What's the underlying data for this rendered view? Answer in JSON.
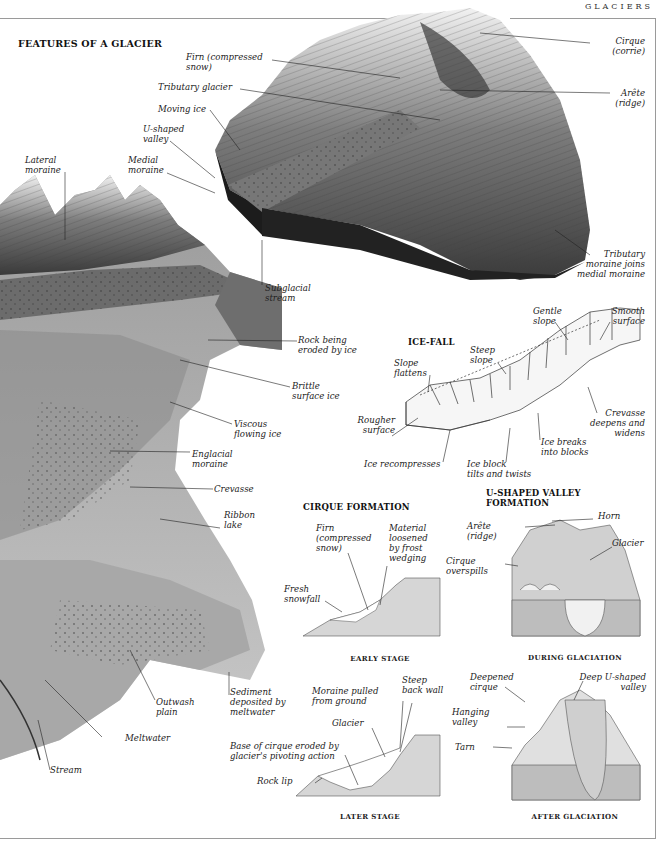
{
  "running_head": "GLACIERS",
  "main_diagram": {
    "title": "FEATURES OF A GLACIER",
    "labels": {
      "firn": "Firn (compressed\nsnow)",
      "tributary_glacier": "Tributary glacier",
      "moving_ice": "Moving ice",
      "u_shaped_valley": "U-shaped\nvalley",
      "medial_moraine": "Medial\nmoraine",
      "lateral_moraine": "Lateral\nmoraine",
      "cirque": "Cirque\n(corrie)",
      "arete": "Arête\n(ridge)",
      "tributary_moraine_joins": "Tributary\nmoraine joins\nmedial moraine",
      "subglacial_stream": "Subglacial\nstream",
      "rock_being_eroded": "Rock being\neroded by ice",
      "brittle_surface_ice": "Brittle\nsurface ice",
      "viscous_flowing_ice": "Viscous\nflowing ice",
      "englacial_moraine": "Englacial\nmoraine",
      "crevasse": "Crevasse",
      "ribbon_lake": "Ribbon\nlake",
      "outwash_plain": "Outwash\nplain",
      "sediment_deposited": "Sediment\ndeposited by\nmeltwater",
      "meltwater": "Meltwater",
      "stream": "Stream"
    }
  },
  "ice_fall": {
    "title": "ICE-FALL",
    "labels": {
      "gentle_slope": "Gentle\nslope",
      "smooth_surface": "Smooth\nsurface",
      "steep_slope": "Steep\nslope",
      "slope_flattens": "Slope\nflattens",
      "rougher_surface": "Rougher\nsurface",
      "crevasse_deepens": "Crevasse\ndeepens and\nwidens",
      "ice_breaks": "Ice breaks\ninto blocks",
      "ice_recompresses": "Ice recompresses",
      "ice_block_tilts": "Ice block\ntilts and twists"
    }
  },
  "cirque_formation": {
    "title": "CIRQUE FORMATION",
    "early": {
      "caption": "EARLY STAGE",
      "labels": {
        "firn": "Firn\n(compressed\nsnow)",
        "material_loosened": "Material\nloosened\nby frost\nwedging",
        "fresh_snowfall": "Fresh\nsnowfall"
      }
    },
    "later": {
      "caption": "LATER STAGE",
      "labels": {
        "moraine_pulled": "Moraine pulled\nfrom ground",
        "steep_back_wall": "Steep\nback wall",
        "glacier": "Glacier",
        "base_of_cirque": "Base of cirque eroded by\nglacier's pivoting action",
        "rock_lip": "Rock lip"
      }
    }
  },
  "u_valley_formation": {
    "title": "U-SHAPED VALLEY\nFORMATION",
    "during": {
      "caption": "DURING GLACIATION",
      "labels": {
        "horn": "Horn",
        "arete": "Arête\n(ridge)",
        "glacier": "Glacier",
        "cirque_overspills": "Cirque\noverspills"
      }
    },
    "after": {
      "caption": "AFTER GLACIATION",
      "labels": {
        "deepened_cirque": "Deepened\ncirque",
        "deep_u_valley": "Deep U-shaped\nvalley",
        "hanging_valley": "Hanging\nvalley",
        "tarn": "Tarn"
      }
    }
  }
}
